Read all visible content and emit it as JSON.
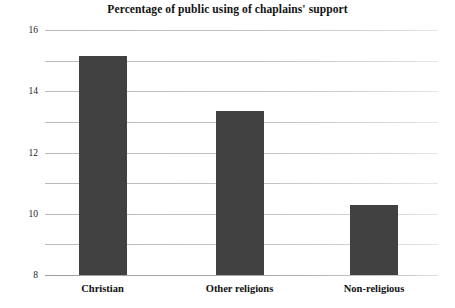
{
  "chart_data": {
    "type": "bar",
    "title": "Percentage of public using of chaplains' support",
    "xlabel": "",
    "ylabel": "",
    "categories": [
      "Christian",
      "Other religions",
      "Non-religious"
    ],
    "values": [
      14.3,
      10.7,
      4.6
    ],
    "series": [
      {
        "name": "Percentage of public using of chaplains' support",
        "values": [
          14.3,
          10.7,
          4.6
        ]
      }
    ],
    "ylim": [
      0,
      16
    ],
    "yticks": [
      0,
      2,
      4,
      6,
      8,
      10,
      12,
      14,
      16
    ],
    "ytick_labels": [
      "0",
      "2",
      "4",
      "6",
      "8",
      "10",
      "12",
      "14",
      "16"
    ],
    "grid": true,
    "grid_axis": "y",
    "legend": false,
    "legend_position": "none",
    "bar_color": "#414141",
    "grid_color": "#c2c2c2",
    "background_color": "#ffffff",
    "text_color": "#111111"
  }
}
